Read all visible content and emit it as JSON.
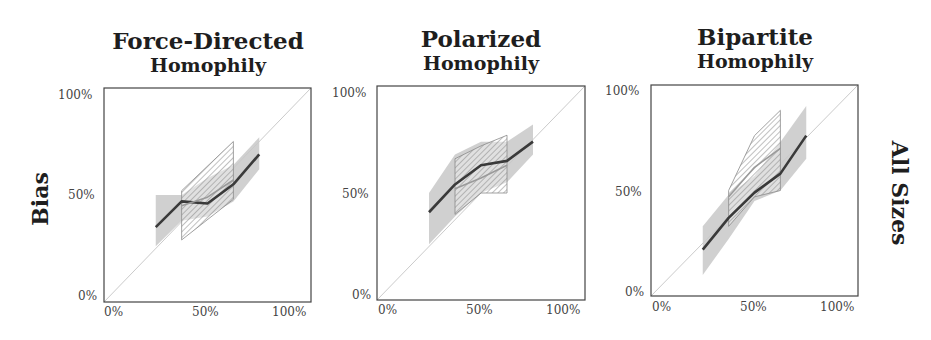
{
  "row_label": "All Sizes",
  "y_axis_label": "Bias",
  "panels": [
    {
      "title_line1": "Force-Directed",
      "title_line2": "Homophily",
      "x_ticks": [
        "0%",
        "50%",
        "100%"
      ],
      "y_ticks": [
        "0%",
        "50%",
        "100%"
      ]
    },
    {
      "title_line1": "Polarized",
      "title_line2": "Homophily",
      "x_ticks": [
        "0%",
        "50%",
        "100%"
      ],
      "y_ticks": [
        "0%",
        "50%",
        "100%"
      ]
    },
    {
      "title_line1": "Bipartite",
      "title_line2": "Homophily",
      "x_ticks": [
        "0%",
        "50%",
        "100%"
      ],
      "y_ticks": [
        "0%",
        "50%",
        "100%"
      ]
    }
  ],
  "colors": {
    "main_line": "#3a3a3a",
    "secondary_line": "#9a9a9a",
    "gray_band": "#c8c8c8",
    "hatch": "#8a8a8a",
    "diagonal": "#bdbdbd",
    "frame": "#444444"
  },
  "chart_data": [
    {
      "type": "line",
      "title": "Force-Directed Homophily",
      "xlabel": "",
      "ylabel": "Bias",
      "xlim": [
        0,
        1
      ],
      "ylim": [
        0,
        1
      ],
      "x_ticks": [
        "0%",
        "50%",
        "100%"
      ],
      "y_ticks": [
        "0%",
        "50%",
        "100%"
      ],
      "reference_line": "y = x diagonal",
      "grid": false,
      "series": [
        {
          "name": "main (dark)",
          "x": [
            0.25,
            0.375,
            0.5,
            0.625,
            0.75
          ],
          "y": [
            0.35,
            0.47,
            0.46,
            0.55,
            0.69
          ]
        },
        {
          "name": "secondary (light)",
          "x": [
            0.375,
            0.5,
            0.625
          ],
          "y": [
            0.45,
            0.49,
            0.57
          ]
        }
      ],
      "bands": [
        {
          "name": "gray band",
          "style": "solid",
          "x": [
            0.25,
            0.375,
            0.5,
            0.625,
            0.75
          ],
          "upper": [
            0.5,
            0.5,
            0.58,
            0.64,
            0.77
          ],
          "lower": [
            0.26,
            0.38,
            0.4,
            0.47,
            0.62
          ]
        },
        {
          "name": "hatched band",
          "style": "hatched",
          "x": [
            0.375,
            0.625
          ],
          "upper": [
            0.52,
            0.75
          ],
          "lower": [
            0.29,
            0.48
          ]
        }
      ]
    },
    {
      "type": "line",
      "title": "Polarized Homophily",
      "xlabel": "",
      "ylabel": "",
      "xlim": [
        0,
        1
      ],
      "ylim": [
        0,
        1
      ],
      "x_ticks": [
        "0%",
        "50%",
        "100%"
      ],
      "y_ticks": [
        "0%",
        "50%",
        "100%"
      ],
      "reference_line": "y = x diagonal",
      "grid": false,
      "series": [
        {
          "name": "main (dark)",
          "x": [
            0.25,
            0.375,
            0.5,
            0.625,
            0.75
          ],
          "y": [
            0.41,
            0.54,
            0.63,
            0.65,
            0.74
          ]
        },
        {
          "name": "secondary (light)",
          "x": [
            0.375,
            0.5,
            0.625
          ],
          "y": [
            0.52,
            0.57,
            0.63
          ]
        }
      ],
      "bands": [
        {
          "name": "gray band",
          "style": "solid",
          "x": [
            0.25,
            0.375,
            0.5,
            0.625,
            0.75
          ],
          "upper": [
            0.5,
            0.68,
            0.74,
            0.74,
            0.82
          ],
          "lower": [
            0.26,
            0.39,
            0.5,
            0.55,
            0.68
          ]
        },
        {
          "name": "hatched band",
          "style": "hatched",
          "x": [
            0.375,
            0.5,
            0.625
          ],
          "upper": [
            0.66,
            0.72,
            0.77
          ],
          "lower": [
            0.4,
            0.5,
            0.5
          ]
        }
      ]
    },
    {
      "type": "line",
      "title": "Bipartite Homophily",
      "xlabel": "",
      "ylabel": "",
      "xlim": [
        0,
        1
      ],
      "ylim": [
        0,
        1
      ],
      "x_ticks": [
        "0%",
        "50%",
        "100%"
      ],
      "y_ticks": [
        "0%",
        "50%",
        "100%"
      ],
      "reference_line": "y = x diagonal",
      "grid": false,
      "row_label": "All Sizes",
      "grid_lines": false,
      "series": [
        {
          "name": "main (dark)",
          "x": [
            0.25,
            0.375,
            0.5,
            0.625,
            0.75
          ],
          "y": [
            0.22,
            0.37,
            0.49,
            0.58,
            0.76
          ]
        },
        {
          "name": "secondary (light)",
          "x": [
            0.375,
            0.5,
            0.625
          ],
          "y": [
            0.47,
            0.61,
            0.7
          ]
        }
      ],
      "bands": [
        {
          "name": "gray band",
          "style": "solid",
          "x": [
            0.25,
            0.375,
            0.5,
            0.625,
            0.75
          ],
          "upper": [
            0.33,
            0.48,
            0.57,
            0.73,
            0.9
          ],
          "lower": [
            0.1,
            0.27,
            0.45,
            0.5,
            0.65
          ]
        },
        {
          "name": "hatched band",
          "style": "hatched",
          "x": [
            0.375,
            0.5,
            0.625
          ],
          "upper": [
            0.5,
            0.76,
            0.88
          ],
          "lower": [
            0.33,
            0.47,
            0.5
          ]
        }
      ]
    }
  ]
}
